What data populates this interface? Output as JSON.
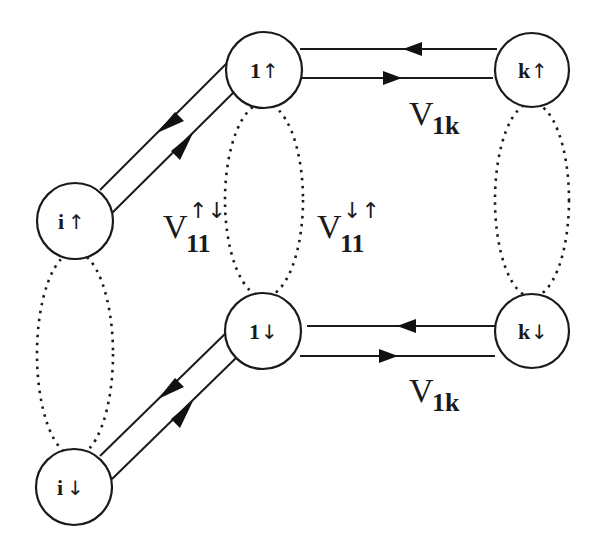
{
  "nodes": [
    {
      "id": "i-up",
      "label": "i",
      "spin": "↑",
      "cx": 75,
      "cy": 221,
      "r": 38
    },
    {
      "id": "i-down",
      "label": "i",
      "spin": "↓",
      "cx": 74,
      "cy": 487,
      "r": 38
    },
    {
      "id": "1-up",
      "label": "1",
      "spin": "↑",
      "cx": 264,
      "cy": 70,
      "r": 38
    },
    {
      "id": "1-down",
      "label": "1",
      "spin": "↓",
      "cx": 263,
      "cy": 331,
      "r": 38
    },
    {
      "id": "k-up",
      "label": "k",
      "spin": "↑",
      "cx": 532,
      "cy": 70,
      "r": 37
    },
    {
      "id": "k-down",
      "label": "k",
      "spin": "↓",
      "cx": 532,
      "cy": 331,
      "r": 37
    }
  ],
  "labels": {
    "v11_updown": {
      "main": "V",
      "sub": "11",
      "sup": "↑↓"
    },
    "v11_downup": {
      "main": "V",
      "sub": "11",
      "sup": "↓↑"
    },
    "v1k_top": {
      "main": "V",
      "sub": "1k"
    },
    "v1k_bottom": {
      "main": "V",
      "sub": "1k"
    }
  },
  "colors": {
    "stroke": "#1a1a1a",
    "background": "#ffffff"
  }
}
